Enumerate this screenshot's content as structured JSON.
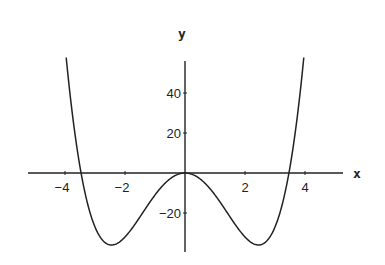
{
  "chart_data": {
    "type": "line",
    "title": "",
    "xlabel": "x",
    "ylabel": "y",
    "function": "y = x^4 - 12x^2",
    "xlim": [
      -5.23,
      5.27
    ],
    "ylim": [
      -39.5,
      56
    ],
    "grid": false,
    "legend": null,
    "x_ticks": [
      -4,
      -2,
      2,
      4
    ],
    "x_tick_labels": [
      "-4",
      "-2",
      "2",
      "4"
    ],
    "y_ticks": [
      40,
      20,
      -20
    ],
    "y_tick_labels": [
      "40",
      "20",
      "-20"
    ],
    "series": [
      {
        "name": "curve",
        "x": [
          -3.95,
          -3.75,
          -3.5,
          -3.46,
          -3.25,
          -3.0,
          -2.75,
          -2.45,
          -2.25,
          -2.0,
          -1.75,
          -1.5,
          -1.25,
          -1.0,
          -0.75,
          -0.5,
          -0.25,
          0,
          0.25,
          0.5,
          0.75,
          1.0,
          1.25,
          1.5,
          1.75,
          2.0,
          2.25,
          2.45,
          2.75,
          3.0,
          3.25,
          3.46,
          3.5,
          3.75,
          3.95
        ],
        "values": [
          55.9,
          28.9,
          3.1,
          0.0,
          -15.2,
          -27.0,
          -33.5,
          -36.0,
          -35.1,
          -32.0,
          -27.4,
          -21.9,
          -16.3,
          -11.0,
          -6.4,
          -2.9,
          -0.7,
          0,
          -0.7,
          -2.9,
          -6.4,
          -11.0,
          -16.3,
          -21.9,
          -27.4,
          -32.0,
          -35.1,
          -36.0,
          -33.5,
          -27.0,
          -15.2,
          0.0,
          3.1,
          28.9,
          55.9
        ]
      }
    ],
    "key_points": {
      "roots": [
        -3.46,
        0,
        3.46
      ],
      "local_max": [
        0,
        0
      ],
      "minima": [
        [
          -2.45,
          -36
        ],
        [
          2.45,
          -36
        ]
      ]
    }
  },
  "labels": {
    "x_axis": "x",
    "y_axis": "y",
    "x_ticks": [
      "-4",
      "-2",
      "2",
      "4"
    ],
    "y_ticks": [
      "40",
      "20",
      "-20"
    ]
  }
}
